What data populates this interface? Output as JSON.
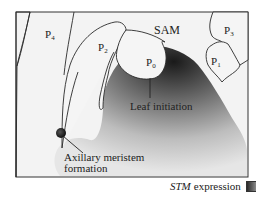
{
  "figure": {
    "labels": {
      "sam": "SAM",
      "p0": {
        "base": "P",
        "sub": "0"
      },
      "p1": {
        "base": "P",
        "sub": "1"
      },
      "p2": {
        "base": "P",
        "sub": "2"
      },
      "p3": {
        "base": "P",
        "sub": "3"
      },
      "p4": {
        "base": "P",
        "sub": "4"
      }
    },
    "annotations": {
      "leaf_initiation": "Leaf initiation",
      "axillary_line1": "Axillary meristem",
      "axillary_line2": "formation"
    },
    "legend": {
      "gene": "STM",
      "text": "expression"
    },
    "colors": {
      "frame": "#333333",
      "background": "#f2f2f2",
      "expression_dark": "#1e1e1e",
      "expression_light": "#dcdcdc",
      "organ_fill": "#f4f4f4",
      "outline": "#2a2a2a"
    }
  }
}
